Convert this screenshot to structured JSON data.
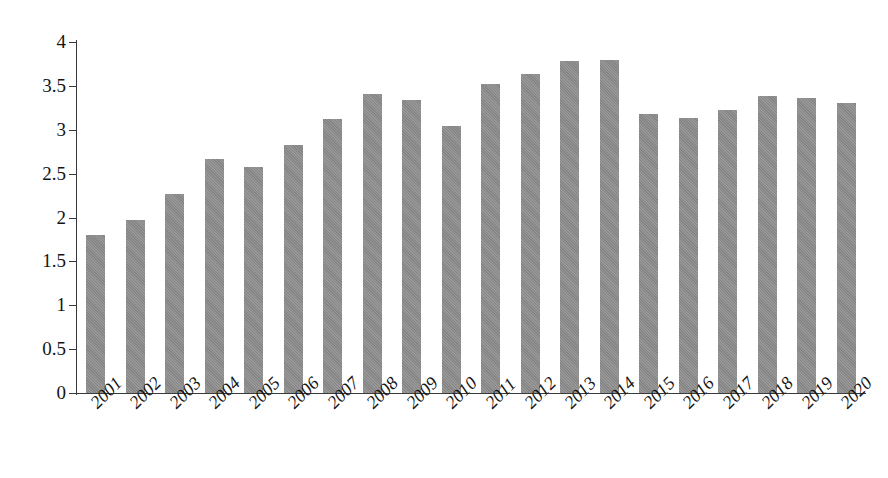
{
  "chart_data": {
    "type": "bar",
    "title": "",
    "subtitle": "",
    "xlabel": "",
    "ylabel": "",
    "categories": [
      "2001",
      "2002",
      "2003",
      "2004",
      "2005",
      "2006",
      "2007",
      "2008",
      "2009",
      "2010",
      "2011",
      "2012",
      "2013",
      "2014",
      "2015",
      "2016",
      "2017",
      "2018",
      "2019",
      "2020"
    ],
    "values": [
      1.8,
      1.97,
      2.27,
      2.67,
      2.58,
      2.83,
      3.12,
      3.41,
      3.34,
      3.04,
      3.52,
      3.64,
      3.78,
      3.8,
      3.18,
      3.13,
      3.22,
      3.38,
      3.36,
      3.31
    ],
    "series": [
      {
        "name": "",
        "values": [
          1.8,
          1.97,
          2.27,
          2.67,
          2.58,
          2.83,
          3.12,
          3.41,
          3.34,
          3.04,
          3.52,
          3.64,
          3.78,
          3.8,
          3.18,
          3.13,
          3.22,
          3.38,
          3.36,
          3.31
        ]
      }
    ],
    "ylim": [
      0,
      4
    ],
    "y_ticks": [
      0,
      0.5,
      1,
      1.5,
      2,
      2.5,
      3,
      3.5,
      4
    ],
    "y_tick_labels": [
      "0",
      "0.5",
      "1",
      "1.5",
      "2",
      "2.5",
      "3",
      "3.5",
      "4"
    ],
    "grid": false,
    "legend": "none",
    "bar_color": "#8c8c8c",
    "axis_color": "#3a3a3a",
    "background_color": "#ffffff",
    "x_label_rotation": -45
  }
}
